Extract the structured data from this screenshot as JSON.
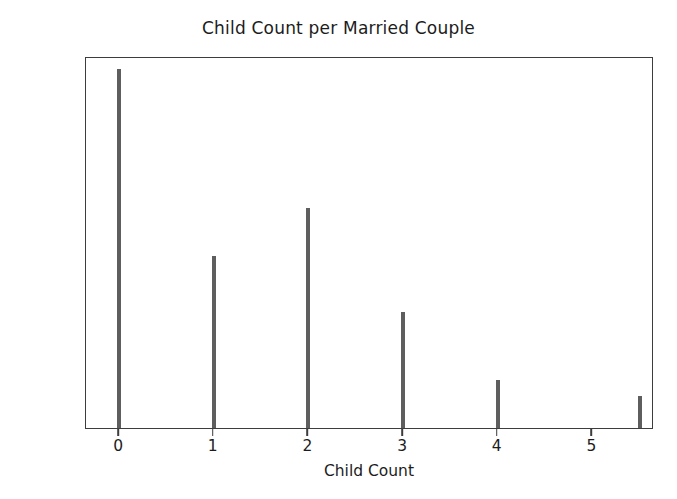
{
  "chart_data": {
    "type": "bar",
    "title": "Child Count per Married Couple",
    "xlabel": "Child Count",
    "ylabel": "",
    "categories": [
      "0",
      "1",
      "2",
      "3",
      "4",
      "5.5"
    ],
    "x": [
      0,
      1,
      2,
      3,
      4,
      5.5
    ],
    "values": [
      2410,
      1155,
      1480,
      780,
      325,
      215
    ],
    "xlim": [
      -0.35,
      5.65
    ],
    "ylim": [
      0,
      2500
    ],
    "xticks": [
      0,
      1,
      2,
      3,
      4,
      5
    ],
    "xtick_labels": [
      "0",
      "1",
      "2",
      "3",
      "4",
      "5"
    ],
    "yticks": [
      0,
      500,
      1000,
      1500,
      2000,
      2500
    ],
    "ytick_labels": [
      "0",
      "500",
      "1000",
      "1500",
      "2000",
      "2500"
    ],
    "grid": false,
    "legend": null,
    "bar_color": "#5e5e5e",
    "axis_color": "#3d3d3d",
    "background_color": "#ffffff",
    "bar_width_units": 0.045
  }
}
